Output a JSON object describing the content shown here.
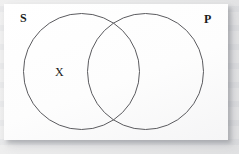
{
  "figure": {
    "kind": "venn-diagram",
    "caption": "",
    "background_color": "#e9e9e9",
    "panel_color": "#fbfbfb",
    "stroke_color": "#5b5b5f",
    "text_color": "#1b1b1b"
  },
  "labels": {
    "subject": "S",
    "predicate": "P"
  },
  "marks": {
    "x": "X"
  },
  "chart_data": {
    "type": "diagram",
    "diagram_type": "venn",
    "title": "",
    "sets": [
      {
        "id": "S",
        "label": "S",
        "label_position": "top-left",
        "cx": 77.5,
        "cy": 67.5,
        "r": 58
      },
      {
        "id": "P",
        "label": "P",
        "label_position": "top-right",
        "cx": 141.5,
        "cy": 67.5,
        "r": 58
      }
    ],
    "regions": [
      {
        "id": "S-only",
        "label": "S and not P",
        "contents": [
          "X"
        ]
      },
      {
        "id": "S-and-P",
        "label": "S and P",
        "contents": []
      },
      {
        "id": "P-only",
        "label": "P and not S",
        "contents": []
      }
    ],
    "annotations": [
      {
        "text": "X",
        "region": "S-only",
        "x": 53,
        "y": 67
      }
    ],
    "legend": [],
    "grid": false
  }
}
